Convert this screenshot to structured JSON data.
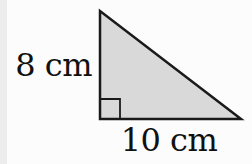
{
  "figure": {
    "type": "right-triangle-diagram",
    "labels": {
      "left_side": "8 cm",
      "bottom_side": "10 cm"
    },
    "geometry": {
      "right_angle_corner": "bottom-left",
      "vertices_px": [
        [
          100,
          11
        ],
        [
          100,
          119
        ],
        [
          241,
          119
        ]
      ],
      "right_angle_marker_size_px": 20
    },
    "colors": {
      "triangle_fill": "#d9d9d9",
      "triangle_stroke": "#1a1a1a",
      "background": "#fcfcfc",
      "edge_strip": "#ededed",
      "text": "#111111"
    }
  }
}
